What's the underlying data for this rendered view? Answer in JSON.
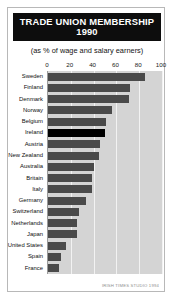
{
  "card": {
    "title_main": "TRADE UNION MEMBERSHIP",
    "title_year": "1990",
    "subtitle": "(as % of wage and salary earners)",
    "credit": "IRISH TIMES STUDIO 1994"
  },
  "colors": {
    "title_background": "#0d0d0d",
    "title_text": "#ffffff",
    "bar": "#4a4a4a",
    "bar_highlight": "#000000",
    "plot_background": "#d4d4d4",
    "gridline": "#f2f2f2",
    "card_border": "#b8b8b8"
  },
  "chart_data": {
    "type": "bar",
    "orientation": "horizontal",
    "title": "TRADE UNION MEMBERSHIP 1990",
    "subtitle": "(as % of wage and salary earners)",
    "xlabel": "",
    "ylabel": "",
    "xlim": [
      0,
      100
    ],
    "xticks": [
      0,
      20,
      40,
      60,
      80,
      100
    ],
    "xtick_labels": [
      "0",
      "20",
      "40",
      "60",
      "80",
      "100"
    ],
    "grid": true,
    "legend": false,
    "highlight_category": "Ireland",
    "categories": [
      "Sweden",
      "Finland",
      "Denmark",
      "Norway",
      "Belgium",
      "Ireland",
      "Austria",
      "New Zealand",
      "Australia",
      "Britain",
      "Italy",
      "Germany",
      "Switzerland",
      "Netherlands",
      "Japan",
      "United States",
      "Spain",
      "France"
    ],
    "values": [
      85,
      72,
      71,
      56,
      51,
      50,
      46,
      45,
      40,
      39,
      39,
      33,
      27,
      25,
      25,
      16,
      11,
      10
    ]
  }
}
